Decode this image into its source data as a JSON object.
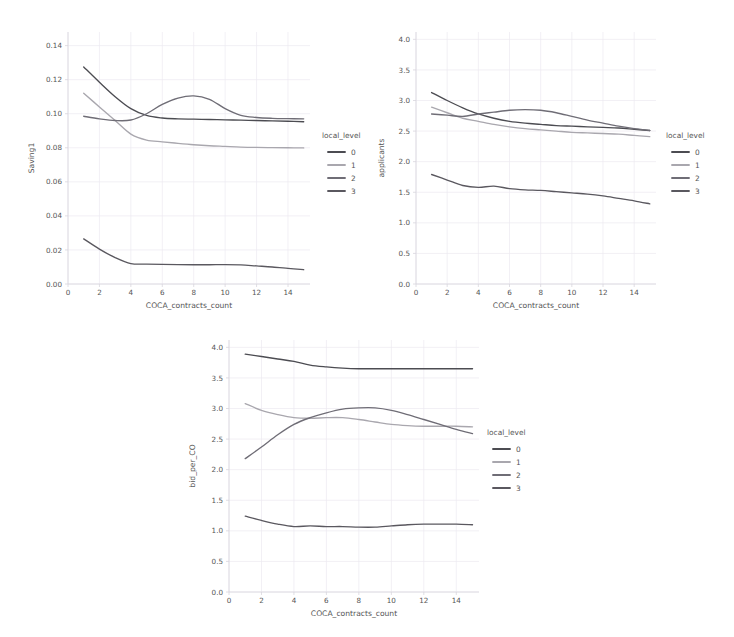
{
  "figure": {
    "background": "#ffffff",
    "panel_count": 3
  },
  "legend": {
    "title": "local_level",
    "entries": [
      {
        "label": "0",
        "color": "#4c4c52"
      },
      {
        "label": "1",
        "color": "#a9a7ae"
      },
      {
        "label": "2",
        "color": "#6f6d76"
      },
      {
        "label": "3",
        "color": "#5a585f"
      }
    ]
  },
  "chart_data": [
    {
      "type": "line",
      "id": "panel-saving1",
      "title": "",
      "xlabel": "COCA_contracts_count",
      "ylabel": "Saving1",
      "xlim": [
        0,
        15.4
      ],
      "ylim": [
        0.0,
        0.148
      ],
      "xticks": [
        0,
        2,
        4,
        6,
        8,
        10,
        12,
        14
      ],
      "yticks": [
        0.0,
        0.02,
        0.04,
        0.06,
        0.08,
        0.1,
        0.12,
        0.14
      ],
      "ytick_labels": [
        "0.00",
        "0.02",
        "0.04",
        "0.06",
        "0.08",
        "0.10",
        "0.12",
        "0.14"
      ],
      "xtick_labels": [
        "0",
        "2",
        "4",
        "6",
        "8",
        "10",
        "12",
        "14"
      ],
      "grid": true,
      "legend_title": "local_level",
      "legend_position": "right",
      "x": [
        1,
        2,
        3,
        4,
        5,
        6,
        7,
        8,
        9,
        10,
        11,
        12,
        13,
        14,
        15
      ],
      "series": [
        {
          "name": "0",
          "color": "#4c4c52",
          "values": [
            0.1275,
            0.1185,
            0.11,
            0.103,
            0.099,
            0.0975,
            0.097,
            0.0968,
            0.0966,
            0.0964,
            0.0962,
            0.096,
            0.0958,
            0.0956,
            0.0953
          ]
        },
        {
          "name": "1",
          "color": "#a9a7ae",
          "values": [
            0.112,
            0.104,
            0.096,
            0.088,
            0.0845,
            0.0835,
            0.0826,
            0.0818,
            0.0812,
            0.0808,
            0.0804,
            0.0802,
            0.0801,
            0.08,
            0.0799
          ]
        },
        {
          "name": "2",
          "color": "#6f6d76",
          "values": [
            0.0985,
            0.097,
            0.096,
            0.0963,
            0.1,
            0.1055,
            0.1092,
            0.1105,
            0.1085,
            0.103,
            0.099,
            0.0978,
            0.0973,
            0.0971,
            0.097
          ]
        },
        {
          "name": "3",
          "color": "#5a585f",
          "values": [
            0.0265,
            0.0205,
            0.0155,
            0.012,
            0.0117,
            0.0115,
            0.0114,
            0.0113,
            0.0113,
            0.0114,
            0.0112,
            0.0106,
            0.01,
            0.0092,
            0.0084
          ]
        }
      ]
    },
    {
      "type": "line",
      "id": "panel-applicants",
      "title": "",
      "xlabel": "COCA_contracts_count",
      "ylabel": "applicants",
      "xlim": [
        0,
        15.4
      ],
      "ylim": [
        0.0,
        4.12
      ],
      "xticks": [
        0,
        2,
        4,
        6,
        8,
        10,
        12,
        14
      ],
      "yticks": [
        0.0,
        0.5,
        1.0,
        1.5,
        2.0,
        2.5,
        3.0,
        3.5,
        4.0
      ],
      "ytick_labels": [
        "0.0",
        "0.5",
        "1.0",
        "1.5",
        "2.0",
        "2.5",
        "3.0",
        "3.5",
        "4.0"
      ],
      "xtick_labels": [
        "0",
        "2",
        "4",
        "6",
        "8",
        "10",
        "12",
        "14"
      ],
      "grid": true,
      "legend_title": "local_level",
      "legend_position": "right",
      "x": [
        1,
        2,
        3,
        4,
        5,
        6,
        7,
        8,
        9,
        10,
        11,
        12,
        13,
        14,
        15
      ],
      "series": [
        {
          "name": "0",
          "color": "#4c4c52",
          "values": [
            3.13,
            3.0,
            2.88,
            2.78,
            2.71,
            2.66,
            2.63,
            2.61,
            2.59,
            2.58,
            2.57,
            2.56,
            2.55,
            2.53,
            2.51
          ]
        },
        {
          "name": "1",
          "color": "#a9a7ae",
          "values": [
            2.89,
            2.8,
            2.71,
            2.66,
            2.61,
            2.57,
            2.54,
            2.52,
            2.5,
            2.48,
            2.47,
            2.46,
            2.45,
            2.43,
            2.41
          ]
        },
        {
          "name": "2",
          "color": "#6f6d76",
          "values": [
            2.78,
            2.76,
            2.74,
            2.78,
            2.81,
            2.84,
            2.85,
            2.84,
            2.8,
            2.74,
            2.68,
            2.63,
            2.58,
            2.54,
            2.51
          ]
        },
        {
          "name": "3",
          "color": "#5a585f",
          "values": [
            1.79,
            1.7,
            1.61,
            1.58,
            1.6,
            1.56,
            1.54,
            1.53,
            1.51,
            1.49,
            1.47,
            1.44,
            1.4,
            1.36,
            1.31
          ]
        }
      ]
    },
    {
      "type": "line",
      "id": "panel-bid-per-co",
      "title": "",
      "xlabel": "COCA_contracts_count",
      "ylabel": "bid_per_CO",
      "xlim": [
        0,
        15.4
      ],
      "ylim": [
        0.0,
        4.12
      ],
      "xticks": [
        0,
        2,
        4,
        6,
        8,
        10,
        12,
        14
      ],
      "yticks": [
        0.0,
        0.5,
        1.0,
        1.5,
        2.0,
        2.5,
        3.0,
        3.5,
        4.0
      ],
      "ytick_labels": [
        "0.0",
        "0.5",
        "1.0",
        "1.5",
        "2.0",
        "2.5",
        "3.0",
        "3.5",
        "4.0"
      ],
      "xtick_labels": [
        "0",
        "2",
        "4",
        "6",
        "8",
        "10",
        "12",
        "14"
      ],
      "grid": true,
      "legend_title": "local_level",
      "legend_position": "right",
      "x": [
        1,
        2,
        3,
        4,
        5,
        6,
        7,
        8,
        9,
        10,
        11,
        12,
        13,
        14,
        15
      ],
      "series": [
        {
          "name": "0",
          "color": "#4c4c52",
          "values": [
            3.89,
            3.85,
            3.81,
            3.77,
            3.71,
            3.68,
            3.66,
            3.65,
            3.65,
            3.65,
            3.65,
            3.65,
            3.65,
            3.65,
            3.65
          ]
        },
        {
          "name": "1",
          "color": "#a9a7ae",
          "values": [
            3.08,
            2.97,
            2.9,
            2.85,
            2.84,
            2.85,
            2.85,
            2.82,
            2.78,
            2.74,
            2.72,
            2.71,
            2.71,
            2.71,
            2.7
          ]
        },
        {
          "name": "2",
          "color": "#6f6d76",
          "values": [
            2.18,
            2.37,
            2.57,
            2.74,
            2.85,
            2.93,
            2.99,
            3.01,
            3.01,
            2.97,
            2.9,
            2.82,
            2.74,
            2.66,
            2.59
          ]
        },
        {
          "name": "3",
          "color": "#5a585f",
          "values": [
            1.24,
            1.17,
            1.11,
            1.07,
            1.08,
            1.07,
            1.07,
            1.06,
            1.06,
            1.08,
            1.1,
            1.11,
            1.11,
            1.11,
            1.1
          ]
        }
      ]
    }
  ]
}
